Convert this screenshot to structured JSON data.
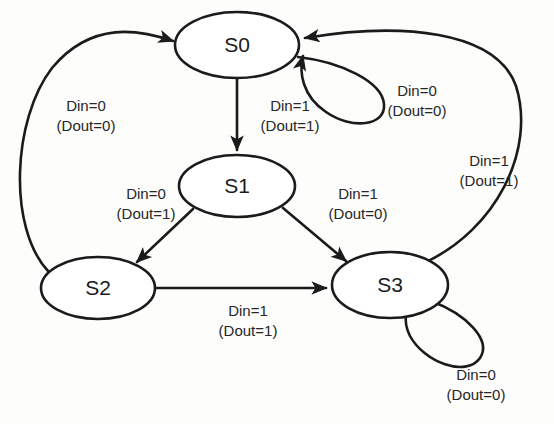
{
  "diagram": {
    "type": "finite-state-machine",
    "background_color": "#fdfdfc",
    "line_color": "#1b1b1b",
    "text_color": "#262626",
    "states": [
      {
        "id": "S0",
        "label": "S0",
        "cx": 237,
        "cy": 45,
        "rx": 62,
        "ry": 33
      },
      {
        "id": "S1",
        "label": "S1",
        "cx": 237,
        "cy": 186,
        "rx": 58,
        "ry": 31
      },
      {
        "id": "S2",
        "label": "S2",
        "cx": 98,
        "cy": 288,
        "rx": 57,
        "ry": 31
      },
      {
        "id": "S3",
        "label": "S3",
        "cx": 390,
        "cy": 285,
        "rx": 58,
        "ry": 33
      }
    ],
    "transitions": [
      {
        "id": "s0-self",
        "from": "S0",
        "to": "S0",
        "input": "Din=0",
        "output": "(Dout=0)",
        "label_x": 417,
        "label_y": 100
      },
      {
        "id": "s0-s1",
        "from": "S0",
        "to": "S1",
        "input": "Din=1",
        "output": "(Dout=1)",
        "label_x": 290,
        "label_y": 117
      },
      {
        "id": "s1-s2",
        "from": "S1",
        "to": "S2",
        "input": "Din=0",
        "output": "(Dout=1)",
        "label_x": 146,
        "label_y": 205
      },
      {
        "id": "s1-s3",
        "from": "S1",
        "to": "S3",
        "input": "Din=1",
        "output": "(Dout=0)",
        "label_x": 358,
        "label_y": 205
      },
      {
        "id": "s2-s0",
        "from": "S2",
        "to": "S0",
        "input": "Din=0",
        "output": "(Dout=0)",
        "label_x": 86,
        "label_y": 117
      },
      {
        "id": "s2-s3",
        "from": "S2",
        "to": "S3",
        "input": "Din=1",
        "output": "(Dout=1)",
        "label_x": 248,
        "label_y": 322
      },
      {
        "id": "s3-s0",
        "from": "S3",
        "to": "S0",
        "input": "Din=1",
        "output": "(Dout=1)",
        "label_x": 489,
        "label_y": 172
      },
      {
        "id": "s3-self",
        "from": "S3",
        "to": "S3",
        "input": "Din=0",
        "output": "(Dout=0)",
        "label_x": 476,
        "label_y": 386
      }
    ]
  }
}
